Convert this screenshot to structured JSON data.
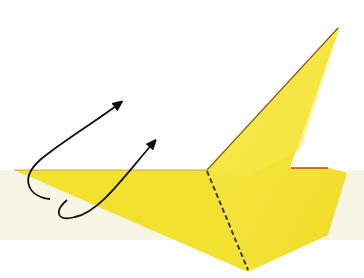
{
  "diagram": {
    "type": "origami-fold-step",
    "colors": {
      "background": "#ffffff",
      "table_surface": "#f7f5e6",
      "paper_front": "#f5e53a",
      "paper_shade": "#efd920",
      "paper_edge": "#8a5a1a",
      "red_edge": "#c8401a",
      "fold_line": "#3a3a55",
      "arrow": "#111111"
    },
    "elements": {
      "table_band": {
        "y_top": 170,
        "y_bottom": 240
      },
      "paper_shape": {
        "points": [
          [
            14,
            170
          ],
          [
            207,
            170
          ],
          [
            340,
            26
          ],
          [
            290,
            168
          ],
          [
            330,
            168
          ],
          [
            347,
            173
          ],
          [
            328,
            235
          ],
          [
            248,
            272
          ],
          [
            14,
            170
          ]
        ]
      },
      "dashed_fold_line": {
        "from": [
          207,
          170
        ],
        "to": [
          248,
          272
        ]
      },
      "arrows": [
        {
          "label": "lift-arrow-upper",
          "path": "M 50 199 C 30 197, 18 180, 40 160 C 60 143, 95 122, 125 100"
        },
        {
          "label": "lift-arrow-lower",
          "path": "M 67 200 C 55 210, 55 222, 75 217 C 100 212, 125 175, 158 138"
        }
      ]
    }
  }
}
